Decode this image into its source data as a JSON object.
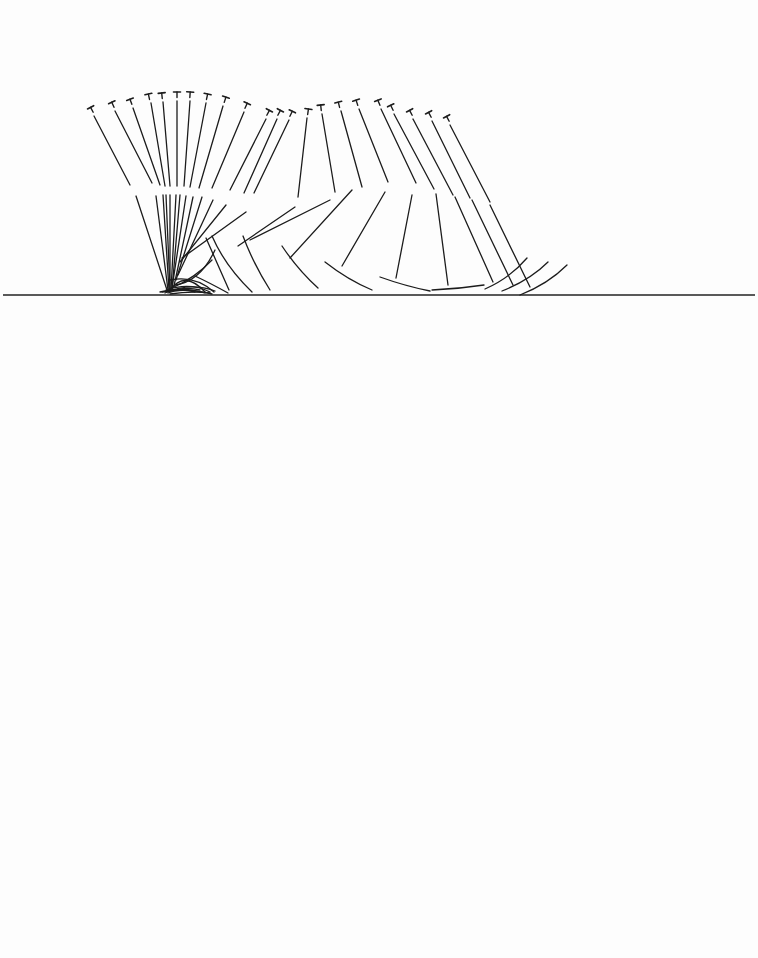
{
  "diagram": {
    "type": "stick-figure-motion-sequence",
    "ground": {
      "x1": 3,
      "x2": 755,
      "y": 295,
      "color": "#222222"
    },
    "line_color": "#1c1c1c",
    "background": "#fdfdfd",
    "head_glyph": "T",
    "figures": [
      {
        "head": [
          92,
          110,
          -28
        ],
        "trunk": [
          94,
          116,
          130,
          185
        ],
        "thigh": [
          136,
          196,
          167,
          290
        ],
        "shank": [
          160,
          292,
          182,
          286,
          205,
          293
        ]
      },
      {
        "head": [
          113,
          105,
          -24
        ],
        "trunk": [
          115,
          111,
          152,
          183
        ],
        "thigh": [
          156,
          196,
          168,
          290
        ],
        "shank": [
          162,
          292,
          190,
          288,
          212,
          294
        ]
      },
      {
        "head": [
          131,
          102,
          -20
        ],
        "trunk": [
          133,
          108,
          160,
          185
        ],
        "thigh": [
          163,
          195,
          169,
          290
        ],
        "shank": [
          165,
          293,
          190,
          282,
          215,
          291
        ]
      },
      {
        "head": [
          149,
          97,
          -12
        ],
        "trunk": [
          151,
          103,
          165,
          186
        ],
        "thigh": [
          166,
          195,
          170,
          290
        ],
        "shank": [
          168,
          292,
          185,
          286,
          200,
          290
        ]
      },
      {
        "head": [
          162,
          96,
          -6
        ],
        "trunk": [
          163,
          102,
          170,
          186
        ],
        "thigh": [
          170,
          195,
          170,
          290
        ],
        "shank": [
          168,
          293,
          180,
          288,
          195,
          292
        ]
      },
      {
        "head": [
          177,
          95,
          0
        ],
        "trunk": [
          177,
          101,
          177,
          186
        ],
        "thigh": [
          176,
          195,
          171,
          290
        ],
        "shank": [
          170,
          294,
          190,
          291,
          210,
          293
        ]
      },
      {
        "head": [
          190,
          95,
          4
        ],
        "trunk": [
          190,
          101,
          184,
          186
        ],
        "thigh": [
          180,
          195,
          172,
          290
        ],
        "shank": [
          170,
          290,
          185,
          270,
          205,
          292
        ]
      },
      {
        "head": [
          207,
          97,
          12
        ],
        "trunk": [
          206,
          103,
          190,
          187
        ],
        "thigh": [
          186,
          196,
          172,
          288
        ],
        "shank": [
          172,
          288,
          195,
          278,
          212,
          260
        ]
      },
      {
        "head": [
          225,
          100,
          18
        ],
        "trunk": [
          223,
          106,
          199,
          188
        ],
        "thigh": [
          193,
          197,
          174,
          286
        ],
        "shank": [
          175,
          285,
          200,
          282,
          215,
          250
        ]
      },
      {
        "head": [
          246,
          106,
          24
        ],
        "trunk": [
          244,
          112,
          212,
          188
        ],
        "thigh": [
          202,
          197,
          176,
          280
        ],
        "shank": [
          166,
          290,
          190,
          282,
          210,
          292
        ]
      },
      {
        "head": [
          268,
          113,
          28
        ],
        "trunk": [
          266,
          119,
          230,
          190
        ],
        "thigh": [
          213,
          200,
          178,
          275
        ],
        "shank": [
          170,
          280,
          195,
          275,
          214,
          292
        ]
      },
      {
        "head": [
          279,
          113,
          28
        ],
        "trunk": [
          277,
          119,
          244,
          193
        ],
        "thigh": [
          226,
          205,
          180,
          262
        ],
        "shank": [
          195,
          276,
          210,
          283,
          228,
          293
        ]
      },
      {
        "head": [
          291,
          114,
          26
        ],
        "trunk": [
          289,
          120,
          254,
          193
        ],
        "thigh": [
          246,
          212,
          182,
          258
        ],
        "shank": [
          206,
          238,
          218,
          265,
          229,
          290
        ]
      },
      {
        "head": [
          308,
          112,
          8
        ],
        "trunk": [
          307,
          118,
          298,
          197
        ],
        "thigh": [
          295,
          207,
          238,
          246
        ],
        "shank": [
          212,
          236,
          225,
          266,
          252,
          292
        ]
      },
      {
        "head": [
          321,
          108,
          -6
        ],
        "trunk": [
          322,
          114,
          335,
          192
        ],
        "thigh": [
          330,
          200,
          250,
          240
        ],
        "shank": [
          243,
          236,
          253,
          263,
          270,
          290
        ]
      },
      {
        "head": [
          339,
          105,
          -14
        ],
        "trunk": [
          341,
          111,
          362,
          187
        ],
        "thigh": [
          352,
          190,
          290,
          258
        ],
        "shank": [
          282,
          246,
          298,
          270,
          318,
          288
        ]
      },
      {
        "head": [
          357,
          103,
          -18
        ],
        "trunk": [
          359,
          109,
          388,
          182
        ],
        "thigh": [
          385,
          192,
          342,
          266
        ],
        "shank": [
          325,
          262,
          348,
          280,
          372,
          290
        ]
      },
      {
        "head": [
          379,
          103,
          -22
        ],
        "trunk": [
          381,
          109,
          416,
          183
        ],
        "thigh": [
          412,
          195,
          396,
          278
        ],
        "shank": [
          380,
          277,
          405,
          286,
          430,
          291
        ]
      },
      {
        "head": [
          392,
          108,
          -26
        ],
        "trunk": [
          394,
          114,
          434,
          189
        ],
        "thigh": [
          436,
          194,
          448,
          285
        ],
        "shank": [
          432,
          290,
          458,
          289,
          484,
          285
        ]
      },
      {
        "head": [
          411,
          113,
          -28
        ],
        "trunk": [
          413,
          119,
          453,
          195
        ],
        "thigh": [
          455,
          197,
          493,
          282
        ],
        "shank": [
          485,
          289,
          510,
          278,
          527,
          258
        ]
      },
      {
        "head": [
          430,
          115,
          -28
        ],
        "trunk": [
          432,
          121,
          470,
          198
        ],
        "thigh": [
          472,
          200,
          513,
          285
        ],
        "shank": [
          502,
          291,
          530,
          280,
          548,
          262
        ]
      },
      {
        "head": [
          448,
          119,
          -28
        ],
        "trunk": [
          450,
          125,
          490,
          202
        ],
        "thigh": [
          490,
          205,
          530,
          287
        ],
        "shank": [
          520,
          295,
          548,
          284,
          567,
          265
        ]
      }
    ]
  }
}
